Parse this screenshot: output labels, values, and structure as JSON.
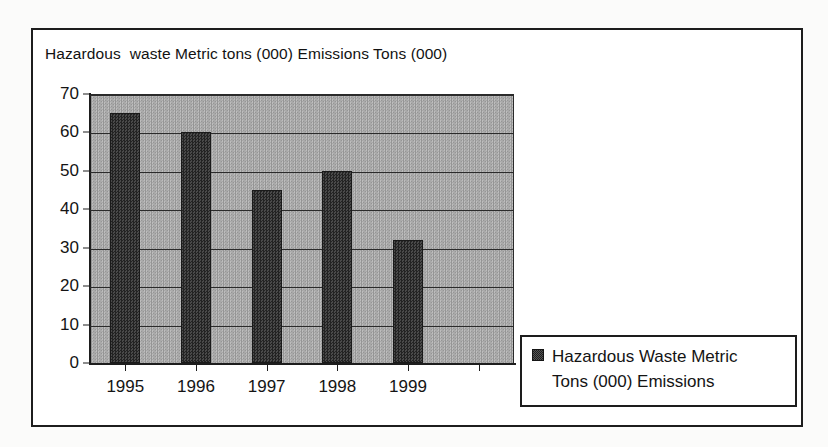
{
  "chart_data": {
    "type": "bar",
    "title": "Hazardous  waste Metric tons (000) Emissions Tons (000)",
    "xlabel": "",
    "ylabel": "",
    "categories": [
      "1995",
      "1996",
      "1997",
      "1998",
      "1999",
      ""
    ],
    "values": [
      65,
      60,
      45,
      50,
      32,
      null
    ],
    "series": [
      {
        "name": "Hazardous  Waste Metric Tons (000) Emissions",
        "values": [
          65,
          60,
          45,
          50,
          32,
          null
        ]
      }
    ],
    "ylim": [
      0,
      70
    ],
    "ytick_labels": [
      "70",
      "60",
      "50",
      "40",
      "30",
      "20",
      "10",
      "0"
    ],
    "ytick_values": [
      70,
      60,
      50,
      40,
      30,
      20,
      10,
      0
    ],
    "grid": true,
    "legend_position": "bottom-right",
    "legend_entries": [
      "Hazardous  Waste Metric Tons (000) Emissions"
    ],
    "colors": {
      "bar": "#333333",
      "plot_background": "#a8a8a8",
      "frame": "#1d1d1d",
      "text": "#141414"
    }
  },
  "legend": {
    "label": "Hazardous  Waste Metric\nTons (000) Emissions"
  }
}
